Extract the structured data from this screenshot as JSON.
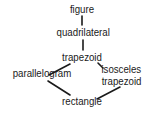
{
  "diagram": {
    "type": "hierarchy",
    "nodes": [
      {
        "id": "figure",
        "label": "figure"
      },
      {
        "id": "quadrilateral",
        "label": "quadrilateral"
      },
      {
        "id": "trapezoid",
        "label": "trapezoid"
      },
      {
        "id": "parallelogram",
        "label": "parallelogram"
      },
      {
        "id": "isosceles_trapezoid",
        "label_line1": "isosceles",
        "label_line2": "trapezoid"
      },
      {
        "id": "rectangle",
        "label": "rectangle"
      }
    ],
    "edges": [
      {
        "from": "figure",
        "to": "quadrilateral"
      },
      {
        "from": "quadrilateral",
        "to": "trapezoid"
      },
      {
        "from": "trapezoid",
        "to": "parallelogram"
      },
      {
        "from": "trapezoid",
        "to": "isosceles_trapezoid"
      },
      {
        "from": "parallelogram",
        "to": "rectangle"
      },
      {
        "from": "isosceles_trapezoid",
        "to": "rectangle"
      }
    ],
    "colors": {
      "text": "#1a1a1a",
      "line": "#1a1a1a",
      "background": "#ffffff"
    }
  }
}
